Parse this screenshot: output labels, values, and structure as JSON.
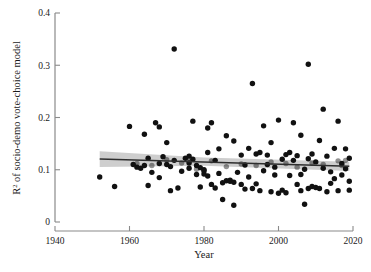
{
  "figure": {
    "background": "#ffffff",
    "point_color": "#111111",
    "line_color": "#2e2e2e",
    "band_color": "#b4b4b4"
  },
  "axes": {
    "x": {
      "label": "Year",
      "min": 1940,
      "max": 2020,
      "ticks": [
        1940,
        1960,
        1980,
        2000,
        2020
      ],
      "tick_labels": [
        "1940",
        "1960",
        "1980",
        "2000",
        "2020"
      ]
    },
    "y": {
      "label_prefix": "R",
      "label_sup": "2",
      "label_rest": " of socio-demo vote-choice model",
      "label": "R² of socio-demo vote-choice model",
      "min": 0,
      "max": 0.4,
      "ticks": [
        0,
        0.1,
        0.2,
        0.3,
        0.4
      ],
      "tick_labels": [
        "0",
        "0.1",
        "0.2",
        "0.3",
        "0.4"
      ]
    }
  },
  "chart_data": {
    "type": "scatter",
    "title": "",
    "xlabel": "Year",
    "ylabel": "R² of socio-demo vote-choice model",
    "xlim": [
      1940,
      2020
    ],
    "ylim": [
      0,
      0.4
    ],
    "grid": false,
    "legend": "none",
    "series": [
      {
        "name": "Election studies",
        "marker": "filled-circle",
        "color": "#111111",
        "points": [
          [
            1952,
            0.086
          ],
          [
            1956,
            0.068
          ],
          [
            1960,
            0.183
          ],
          [
            1961,
            0.11
          ],
          [
            1962,
            0.105
          ],
          [
            1963,
            0.103
          ],
          [
            1964,
            0.168
          ],
          [
            1964,
            0.108
          ],
          [
            1965,
            0.07
          ],
          [
            1965,
            0.122
          ],
          [
            1966,
            0.095
          ],
          [
            1967,
            0.19
          ],
          [
            1968,
            0.182
          ],
          [
            1968,
            0.112
          ],
          [
            1968,
            0.085
          ],
          [
            1969,
            0.125
          ],
          [
            1970,
            0.152
          ],
          [
            1970,
            0.11
          ],
          [
            1971,
            0.06
          ],
          [
            1971,
            0.106
          ],
          [
            1972,
            0.331
          ],
          [
            1972,
            0.118
          ],
          [
            1973,
            0.065
          ],
          [
            1974,
            0.097
          ],
          [
            1975,
            0.122
          ],
          [
            1976,
            0.126
          ],
          [
            1976,
            0.113
          ],
          [
            1976,
            0.103
          ],
          [
            1977,
            0.193
          ],
          [
            1977,
            0.12
          ],
          [
            1978,
            0.108
          ],
          [
            1978,
            0.091
          ],
          [
            1979,
            0.067
          ],
          [
            1979,
            0.104
          ],
          [
            1980,
            0.1
          ],
          [
            1980,
            0.098
          ],
          [
            1980,
            0.092
          ],
          [
            1981,
            0.18
          ],
          [
            1981,
            0.133
          ],
          [
            1981,
            0.088
          ],
          [
            1982,
            0.19
          ],
          [
            1982,
            0.072
          ],
          [
            1983,
            0.065
          ],
          [
            1983,
            0.118
          ],
          [
            1984,
            0.14
          ],
          [
            1984,
            0.093
          ],
          [
            1985,
            0.043
          ],
          [
            1985,
            0.075
          ],
          [
            1986,
            0.165
          ],
          [
            1986,
            0.079
          ],
          [
            1987,
            0.078
          ],
          [
            1987,
            0.08
          ],
          [
            1988,
            0.032
          ],
          [
            1988,
            0.076
          ],
          [
            1988,
            0.155
          ],
          [
            1989,
            0.095
          ],
          [
            1990,
            0.128
          ],
          [
            1990,
            0.072
          ],
          [
            1991,
            0.063
          ],
          [
            1991,
            0.109
          ],
          [
            1992,
            0.141
          ],
          [
            1992,
            0.086
          ],
          [
            1993,
            0.265
          ],
          [
            1993,
            0.064
          ],
          [
            1994,
            0.13
          ],
          [
            1994,
            0.073
          ],
          [
            1995,
            0.133
          ],
          [
            1995,
            0.06
          ],
          [
            1996,
            0.184
          ],
          [
            1996,
            0.098
          ],
          [
            1997,
            0.128
          ],
          [
            1997,
            0.11
          ],
          [
            1998,
            0.152
          ],
          [
            1998,
            0.058
          ],
          [
            1999,
            0.105
          ],
          [
            1999,
            0.09
          ],
          [
            2000,
            0.195
          ],
          [
            2000,
            0.055
          ],
          [
            2001,
            0.12
          ],
          [
            2001,
            0.061
          ],
          [
            2002,
            0.129
          ],
          [
            2002,
            0.056
          ],
          [
            2003,
            0.133
          ],
          [
            2003,
            0.089
          ],
          [
            2004,
            0.19
          ],
          [
            2004,
            0.118
          ],
          [
            2005,
            0.127
          ],
          [
            2005,
            0.072
          ],
          [
            2006,
            0.166
          ],
          [
            2006,
            0.091
          ],
          [
            2006,
            0.06
          ],
          [
            2007,
            0.034
          ],
          [
            2007,
            0.101
          ],
          [
            2008,
            0.302
          ],
          [
            2008,
            0.121
          ],
          [
            2008,
            0.064
          ],
          [
            2009,
            0.13
          ],
          [
            2009,
            0.068
          ],
          [
            2010,
            0.066
          ],
          [
            2010,
            0.115
          ],
          [
            2011,
            0.156
          ],
          [
            2011,
            0.064
          ],
          [
            2012,
            0.216
          ],
          [
            2012,
            0.103
          ],
          [
            2013,
            0.126
          ],
          [
            2013,
            0.058
          ],
          [
            2014,
            0.096
          ],
          [
            2014,
            0.074
          ],
          [
            2015,
            0.141
          ],
          [
            2015,
            0.083
          ],
          [
            2016,
            0.193
          ],
          [
            2016,
            0.06
          ],
          [
            2017,
            0.112
          ],
          [
            2017,
            0.09
          ],
          [
            2018,
            0.14
          ],
          [
            2018,
            0.102
          ],
          [
            2019,
            0.122
          ],
          [
            2019,
            0.078
          ],
          [
            2019,
            0.061
          ]
        ]
      },
      {
        "name": "Overlapping observations",
        "marker": "filled-circle-translucent",
        "color": "#111111",
        "opacity": 0.46,
        "points": [
          [
            1962,
            0.112
          ],
          [
            1966,
            0.108
          ],
          [
            1970,
            0.119
          ],
          [
            1974,
            0.113
          ],
          [
            1976,
            0.116
          ],
          [
            1978,
            0.101
          ],
          [
            1982,
            0.117
          ],
          [
            1986,
            0.106
          ],
          [
            1990,
            0.111
          ],
          [
            1994,
            0.108
          ],
          [
            1998,
            0.115
          ],
          [
            2002,
            0.112
          ],
          [
            2005,
            0.105
          ],
          [
            2009,
            0.113
          ],
          [
            2012,
            0.11
          ],
          [
            2016,
            0.117
          ],
          [
            2017,
            0.108
          ],
          [
            2018,
            0.118
          ]
        ]
      }
    ],
    "fit": {
      "type": "linear-regression",
      "line": [
        [
          1952,
          0.1205
        ],
        [
          2019,
          0.1065
        ]
      ],
      "confidence_band": {
        "upper": [
          [
            1952,
            0.1355
          ],
          [
            1980,
            0.1235
          ],
          [
            2019,
            0.1155
          ]
        ],
        "lower": [
          [
            1952,
            0.1055
          ],
          [
            1980,
            0.1075
          ],
          [
            2019,
            0.0975
          ]
        ]
      }
    }
  }
}
